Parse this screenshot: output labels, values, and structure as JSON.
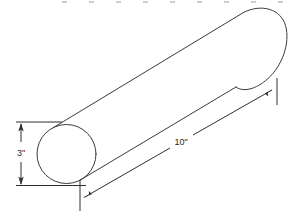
{
  "figure": {
    "shape_name": "cylinder",
    "background_color": "#ffffff",
    "line_color": "#3a3a3a",
    "dimension_line_color": "#2e2e2e",
    "border_color": "#bdbdbd"
  },
  "dimensions": {
    "diameter": {
      "label": "3\"",
      "value": 3,
      "unit": "inch",
      "orientation": "vertical",
      "measures": "diameter"
    },
    "length": {
      "label": "10\"",
      "value": 10,
      "unit": "inch",
      "orientation": "diagonal",
      "measures": "length"
    }
  },
  "icons": {
    "arrow_up": "arrow-up-icon",
    "arrow_down": "arrow-down-icon",
    "arrow_diagonal_lower_left": "arrow-diagonal-lower-left-icon",
    "arrow_diagonal_upper_right": "arrow-diagonal-upper-right-icon"
  }
}
